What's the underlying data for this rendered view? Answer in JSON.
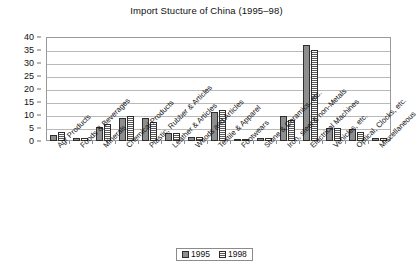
{
  "chart_data": {
    "type": "bar",
    "title": "Import Stucture of China (1995–98)",
    "xlabel": "",
    "ylabel": "",
    "ylim": [
      0,
      40
    ],
    "yticks": [
      0,
      5,
      10,
      15,
      20,
      25,
      30,
      35,
      40
    ],
    "grid": true,
    "legend_position": "bottom-center",
    "categories": [
      "Agr Products",
      "Foods & Beverages",
      "Minerals",
      "Chemical Products",
      "Plastic, Rubber & Articles",
      "Leather & Articles",
      "Woods and Articles",
      "Textile & Apparel",
      "Footwears",
      "Stone & Ceramics, etc.",
      "Iron, steel & non-Metals",
      "Electrical Machines",
      "Vehicles, etc.",
      "Optical, Clocks, etc.",
      "Miscellaneous"
    ],
    "series": [
      {
        "name": "1995",
        "color": "#8e8e8e",
        "values": [
          2.5,
          1.0,
          5.5,
          9.0,
          9.0,
          3.0,
          1.5,
          11.0,
          0.3,
          1.0,
          9.5,
          37.0,
          5.0,
          4.5,
          1.0
        ]
      },
      {
        "name": "1998",
        "color": "#5a5a5a",
        "values": [
          3.5,
          1.0,
          6.5,
          9.5,
          7.5,
          3.0,
          1.5,
          12.0,
          0.3,
          1.0,
          8.0,
          35.0,
          5.0,
          3.5,
          1.0
        ]
      }
    ]
  },
  "legend": {
    "items": [
      {
        "label": "1995"
      },
      {
        "label": "1998"
      }
    ]
  }
}
